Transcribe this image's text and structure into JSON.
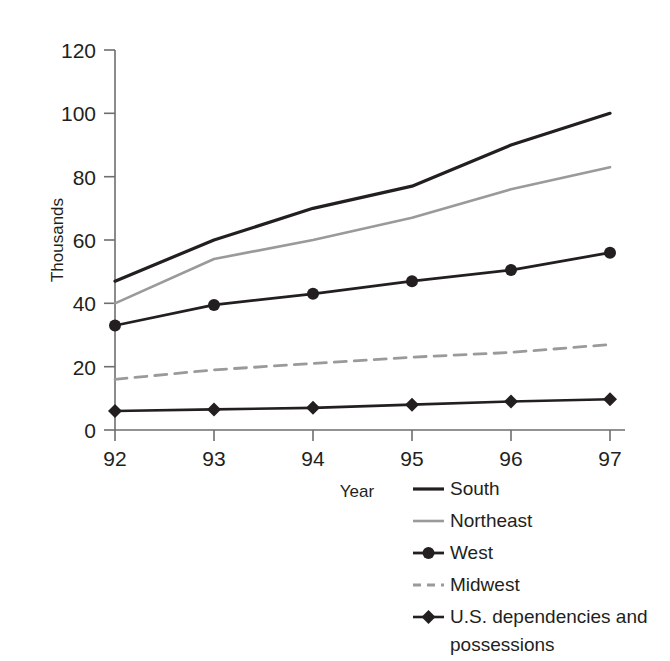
{
  "chart_data": {
    "type": "line",
    "title": "",
    "xlabel": "Year",
    "ylabel": "Thousands",
    "categories": [
      "92",
      "93",
      "94",
      "95",
      "96",
      "97"
    ],
    "x": [
      92,
      93,
      94,
      95,
      96,
      97
    ],
    "xlim": [
      92,
      97
    ],
    "ylim": [
      0,
      120
    ],
    "yticks": [
      0,
      20,
      40,
      60,
      80,
      100,
      120
    ],
    "ytick_labels": [
      "0",
      "20",
      "40",
      "60",
      "80",
      "100",
      "120"
    ],
    "grid": false,
    "legend_position": "bottom-right",
    "series": [
      {
        "name": "South",
        "values": [
          47,
          60,
          70,
          77,
          90,
          100
        ],
        "color": "#231f20",
        "style": "solid",
        "marker": "none",
        "width": 3.2
      },
      {
        "name": "Northeast",
        "values": [
          40,
          54,
          60,
          67,
          76,
          83
        ],
        "color": "#9a9a9c",
        "style": "solid",
        "marker": "none",
        "width": 2.6
      },
      {
        "name": "West",
        "values": [
          33,
          39.5,
          43,
          47,
          50.5,
          56
        ],
        "color": "#231f20",
        "style": "solid",
        "marker": "circle",
        "width": 2.8
      },
      {
        "name": "Midwest",
        "values": [
          16,
          19,
          21,
          23,
          24.5,
          27
        ],
        "color": "#9a9a9c",
        "style": "dashed",
        "marker": "none",
        "width": 2.8
      },
      {
        "name": "U.S. dependencies and possessions",
        "values": [
          6,
          6.5,
          7,
          8,
          9,
          9.7
        ],
        "color": "#231f20",
        "style": "solid",
        "marker": "diamond",
        "width": 2.6
      }
    ]
  },
  "axes": {
    "y_title": "Thousands",
    "x_title": "Year",
    "y_tick_labels": [
      "120",
      "100",
      "80",
      "60",
      "40",
      "20",
      "0"
    ],
    "x_tick_labels": [
      "92",
      "93",
      "94",
      "95",
      "96",
      "97"
    ]
  },
  "legend": {
    "entries": [
      {
        "label": "South",
        "label2": ""
      },
      {
        "label": "Northeast",
        "label2": ""
      },
      {
        "label": "West",
        "label2": ""
      },
      {
        "label": "Midwest",
        "label2": ""
      },
      {
        "label": "U.S. dependencies and",
        "label2": "possessions"
      }
    ]
  }
}
